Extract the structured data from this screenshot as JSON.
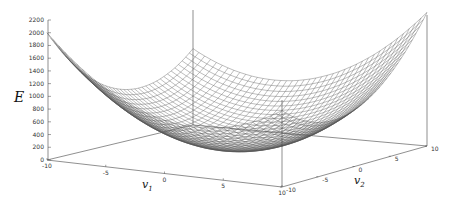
{
  "chart_data": {
    "type": "surface3d",
    "title": "",
    "zlabel": "E",
    "xlabel": "v",
    "xlabel_sub": "1",
    "ylabel": "v",
    "ylabel_sub": "2",
    "zlim": [
      0,
      2200
    ],
    "z_ticks": [
      "2200",
      "2000",
      "1800",
      "1600",
      "1400",
      "1200",
      "1000",
      "800",
      "600",
      "400",
      "200",
      "0"
    ],
    "x_ticks": [
      "-10",
      "-5",
      "0",
      "5",
      "10"
    ],
    "y_ticks": [
      "-10",
      "-5",
      "0",
      "5",
      "10"
    ],
    "xlim": [
      -10,
      10
    ],
    "ylim": [
      -10,
      10
    ],
    "surface": {
      "description": "Convex quadratic bowl E(v1,v2), wireframe mesh, gray",
      "grid_steps": 40,
      "corner_values": {
        "v1=-10,v2=-10": 2000,
        "v1=-10,v2=10": 1200,
        "v1=10,v2=-10": 1200,
        "v1=10,v2=10": 2100
      },
      "minimum_approx": 100
    },
    "colors": {
      "mesh": "#555555",
      "axes": "#444444",
      "background": "#ffffff"
    },
    "grid": false
  }
}
